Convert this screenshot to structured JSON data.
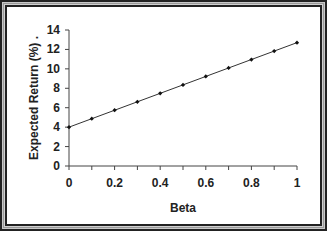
{
  "chart_data": {
    "type": "line",
    "title": "",
    "xlabel": "Beta",
    "ylabel": "Expected Return (%) .",
    "x": [
      0,
      0.1,
      0.2,
      0.3,
      0.4,
      0.5,
      0.6,
      0.7,
      0.8,
      0.9,
      1.0
    ],
    "series": [
      {
        "name": "Security Market Line",
        "values": [
          4.0,
          4.87,
          5.74,
          6.61,
          7.48,
          8.35,
          9.22,
          10.09,
          10.96,
          11.83,
          12.7
        ],
        "color": "#333333",
        "marker": "diamond"
      }
    ],
    "xlim": [
      0,
      1
    ],
    "ylim": [
      0,
      14
    ],
    "xticks": [
      "0",
      "0.2",
      "0.4",
      "0.6",
      "0.8",
      "1"
    ],
    "yticks": [
      "0",
      "2",
      "4",
      "6",
      "8",
      "10",
      "12",
      "14"
    ],
    "grid": false,
    "legend": "none"
  }
}
